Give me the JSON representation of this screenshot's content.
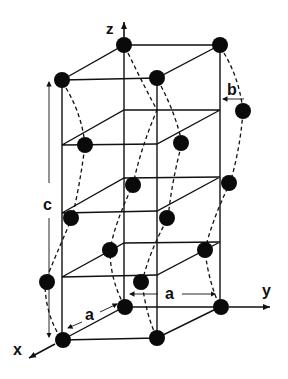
{
  "diagram": {
    "type": "crystal-lattice",
    "axes": {
      "x": "x",
      "y": "y",
      "z": "z"
    },
    "dimensions": {
      "a_front": "a",
      "a_right": "a",
      "b": "b",
      "c": "c"
    },
    "colors": {
      "atom": "#0a0a0a",
      "line": "#111111",
      "background": "#ffffff"
    },
    "atom_count": 19
  }
}
